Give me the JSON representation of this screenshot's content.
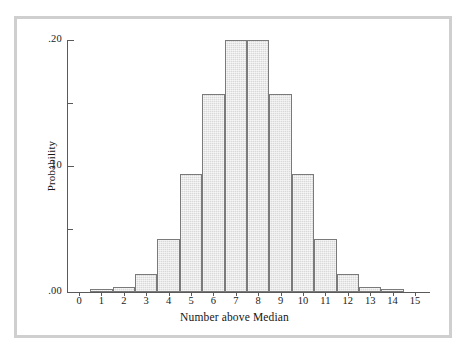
{
  "figure": {
    "background_color": "#ffffff",
    "frame_color": "#cfcfcf",
    "bar_fill": "#d9d9d9",
    "bar_edge": "#7a7a7a",
    "axis_color": "#5a5a5a"
  },
  "chart_data": {
    "type": "bar",
    "title": "",
    "xlabel": "Number above Median",
    "ylabel": "Probability",
    "categories": [
      "0",
      "1",
      "2",
      "3",
      "4",
      "5",
      "6",
      "7",
      "8",
      "9",
      "10",
      "11",
      "12",
      "13",
      "14",
      "15"
    ],
    "values": [
      0.0,
      0.002,
      0.004,
      0.014,
      0.042,
      0.094,
      0.157,
      0.2,
      0.2,
      0.157,
      0.094,
      0.042,
      0.014,
      0.004,
      0.002,
      0.0
    ],
    "xlim": [
      -0.5,
      15.5
    ],
    "ylim": [
      0.0,
      0.2
    ],
    "ytick_values": [
      0.0,
      0.05,
      0.1,
      0.15,
      0.2
    ],
    "ytick_labels": [
      ".00",
      "",
      ".10",
      "",
      ".20"
    ],
    "ytick_major": [
      true,
      false,
      true,
      false,
      true
    ],
    "xtick_labels": [
      "0",
      "1",
      "2",
      "3",
      "4",
      "5",
      "6",
      "7",
      "8",
      "9",
      "10",
      "11",
      "12",
      "13",
      "14",
      "15"
    ],
    "grid": false,
    "legend": null
  }
}
